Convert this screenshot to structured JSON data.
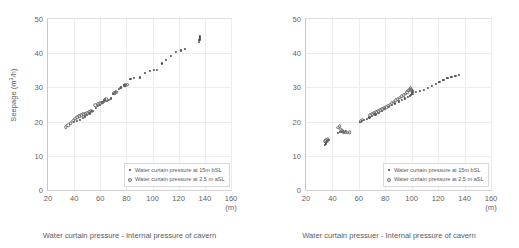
{
  "chart_data": [
    {
      "id": "seepage",
      "type": "scatter",
      "title": "",
      "xlabel": "Water curtain pressure - Internal pressure of cavern",
      "ylabel": "Seepage (m³/h)",
      "xunit": "(m)",
      "xlim": [
        20,
        160
      ],
      "ylim": [
        0,
        50
      ],
      "xticks": [
        20,
        40,
        60,
        80,
        100,
        120,
        140,
        160
      ],
      "yticks": [
        0,
        10,
        20,
        30,
        40,
        50
      ],
      "grid": true,
      "legend_position": "lower-right",
      "series": [
        {
          "name": "Water curtain pressure at 15m bSL",
          "marker": "filled",
          "points": [
            [
              40.0,
              19.8
            ],
            [
              42.0,
              20.2
            ],
            [
              44.5,
              20.6
            ],
            [
              46.5,
              21.0
            ],
            [
              48.0,
              21.5
            ],
            [
              50.0,
              22.0
            ],
            [
              52.0,
              22.4
            ],
            [
              54.0,
              23.2
            ],
            [
              56.5,
              24.1
            ],
            [
              58.0,
              24.6
            ],
            [
              60.0,
              25.0
            ],
            [
              61.5,
              25.6
            ],
            [
              62.5,
              26.2
            ],
            [
              63.5,
              26.6
            ],
            [
              65.0,
              26.1
            ],
            [
              66.5,
              26.3
            ],
            [
              68.0,
              26.8
            ],
            [
              70.0,
              28.2
            ],
            [
              71.5,
              28.6
            ],
            [
              74.0,
              29.6
            ],
            [
              76.0,
              30.0
            ],
            [
              78.5,
              30.6
            ],
            [
              83.0,
              32.4
            ],
            [
              86.0,
              32.8
            ],
            [
              90.0,
              32.9
            ],
            [
              94.0,
              34.2
            ],
            [
              98.0,
              34.9
            ],
            [
              101.0,
              35.2
            ],
            [
              103.5,
              35.2
            ],
            [
              107.0,
              37.0
            ],
            [
              110.5,
              38.0
            ],
            [
              114.0,
              39.1
            ],
            [
              118.0,
              40.3
            ],
            [
              121.5,
              40.8
            ],
            [
              125.0,
              41.3
            ],
            [
              135.5,
              43.4
            ],
            [
              135.8,
              43.9
            ],
            [
              136.0,
              44.3
            ],
            [
              136.2,
              44.7
            ],
            [
              136.4,
              45.0
            ]
          ]
        },
        {
          "name": "Water curtain pressure at 2.5 m aSL",
          "marker": "open",
          "points": [
            [
              33.5,
              18.3
            ],
            [
              35.5,
              18.9
            ],
            [
              37.5,
              19.6
            ],
            [
              39.5,
              20.3
            ],
            [
              41.0,
              20.9
            ],
            [
              42.5,
              21.3
            ],
            [
              44.0,
              21.6
            ],
            [
              45.5,
              21.9
            ],
            [
              47.0,
              22.1
            ],
            [
              48.5,
              22.3
            ],
            [
              50.0,
              22.5
            ],
            [
              51.5,
              22.7
            ],
            [
              53.0,
              23.0
            ],
            [
              56.0,
              24.8
            ],
            [
              58.5,
              25.2
            ],
            [
              60.0,
              25.4
            ],
            [
              61.5,
              25.5
            ],
            [
              62.5,
              25.8
            ],
            [
              63.5,
              26.2
            ],
            [
              64.5,
              26.5
            ],
            [
              70.5,
              28.3
            ],
            [
              72.0,
              28.6
            ],
            [
              75.5,
              29.9
            ],
            [
              79.0,
              30.6
            ],
            [
              80.5,
              30.8
            ]
          ]
        }
      ]
    },
    {
      "id": "water-supply",
      "type": "scatter",
      "title": "",
      "xlabel": "Water curtain pressuer - Internal pressure of cavern",
      "ylabel": "Water supply (m³/h)",
      "xunit": "(m)",
      "xlim": [
        20,
        160
      ],
      "ylim": [
        0,
        50
      ],
      "xticks": [
        20,
        40,
        60,
        80,
        100,
        120,
        140,
        160
      ],
      "yticks": [
        0,
        10,
        20,
        30,
        40,
        50
      ],
      "grid": true,
      "legend_position": "lower-right",
      "series": [
        {
          "name": "Water curtain pressure at 15m bSL",
          "marker": "filled",
          "points": [
            [
              34.0,
              13.3
            ],
            [
              34.8,
              13.6
            ],
            [
              35.5,
              14.0
            ],
            [
              36.2,
              14.4
            ],
            [
              37.0,
              14.7
            ],
            [
              44.0,
              16.6
            ],
            [
              45.5,
              16.9
            ],
            [
              47.0,
              17.0
            ],
            [
              48.5,
              17.1
            ],
            [
              50.0,
              17.2
            ],
            [
              60.5,
              19.8
            ],
            [
              62.0,
              20.2
            ],
            [
              64.0,
              20.5
            ],
            [
              66.0,
              20.8
            ],
            [
              68.0,
              21.2
            ],
            [
              70.0,
              21.6
            ],
            [
              72.5,
              22.1
            ],
            [
              75.0,
              22.6
            ],
            [
              77.5,
              23.2
            ],
            [
              80.0,
              23.6
            ],
            [
              82.5,
              24.2
            ],
            [
              85.0,
              24.8
            ],
            [
              87.5,
              25.3
            ],
            [
              90.0,
              25.9
            ],
            [
              92.5,
              26.4
            ],
            [
              95.0,
              26.8
            ],
            [
              97.0,
              27.2
            ],
            [
              98.5,
              27.6
            ],
            [
              99.5,
              27.9
            ],
            [
              100.0,
              28.1
            ],
            [
              100.3,
              28.4
            ],
            [
              100.5,
              28.7
            ],
            [
              100.7,
              29.0
            ],
            [
              101.0,
              28.2
            ],
            [
              103.0,
              28.6
            ],
            [
              106.0,
              29.0
            ],
            [
              109.0,
              29.3
            ],
            [
              112.0,
              29.9
            ],
            [
              115.0,
              30.5
            ],
            [
              118.0,
              31.1
            ],
            [
              121.0,
              31.7
            ],
            [
              124.0,
              32.2
            ],
            [
              127.0,
              32.7
            ],
            [
              130.0,
              33.1
            ],
            [
              133.0,
              33.4
            ],
            [
              135.5,
              33.6
            ]
          ]
        },
        {
          "name": "Water curtain pressure at 2.5 m aSL",
          "marker": "open",
          "points": [
            [
              34.5,
              14.2
            ],
            [
              35.5,
              14.5
            ],
            [
              36.5,
              14.9
            ],
            [
              44.5,
              18.2
            ],
            [
              45.5,
              18.6
            ],
            [
              46.5,
              17.6
            ],
            [
              47.5,
              17.2
            ],
            [
              48.5,
              16.9
            ],
            [
              50.0,
              16.8
            ],
            [
              51.5,
              16.8
            ],
            [
              53.0,
              16.9
            ],
            [
              61.5,
              20.1
            ],
            [
              63.0,
              20.5
            ],
            [
              68.5,
              21.9
            ],
            [
              70.0,
              22.2
            ],
            [
              71.5,
              22.4
            ],
            [
              73.0,
              22.7
            ],
            [
              74.5,
              23.0
            ],
            [
              76.0,
              23.3
            ],
            [
              77.5,
              23.6
            ],
            [
              79.0,
              23.9
            ],
            [
              80.5,
              24.2
            ],
            [
              82.0,
              24.6
            ],
            [
              83.5,
              25.0
            ],
            [
              85.0,
              25.4
            ],
            [
              86.5,
              25.8
            ],
            [
              88.0,
              26.2
            ],
            [
              89.5,
              26.6
            ],
            [
              91.0,
              27.0
            ],
            [
              92.5,
              27.4
            ],
            [
              94.0,
              27.8
            ],
            [
              95.5,
              28.2
            ],
            [
              96.5,
              28.6
            ],
            [
              97.5,
              29.0
            ],
            [
              98.5,
              29.4
            ],
            [
              99.2,
              29.7
            ],
            [
              99.8,
              29.3
            ],
            [
              100.2,
              28.9
            ]
          ]
        }
      ]
    }
  ]
}
